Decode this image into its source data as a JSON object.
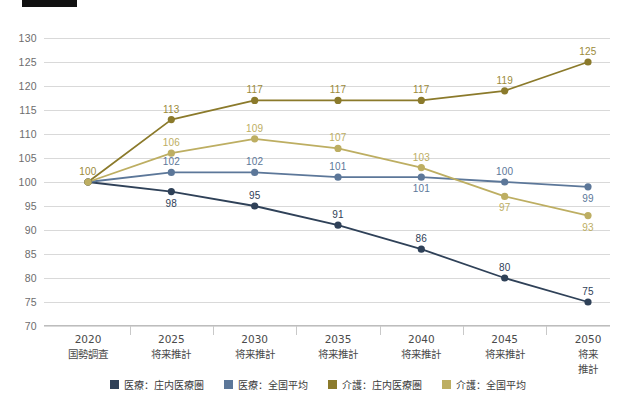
{
  "header": {
    "rule_label": ""
  },
  "chart_data": {
    "type": "line",
    "title": "",
    "xlabel": "",
    "ylabel": "",
    "ylim": [
      70,
      130
    ],
    "ystep": 5,
    "grid": true,
    "legend_position": "bottom",
    "yticks": [
      130,
      125,
      120,
      115,
      110,
      105,
      100,
      95,
      90,
      85,
      80,
      75,
      70
    ],
    "categories": [
      "2020",
      "2025",
      "2030",
      "2035",
      "2040",
      "2045",
      "2050"
    ],
    "category_sublabels": [
      "国勢調査",
      "将来推計",
      "将来推計",
      "将来推計",
      "将来推計",
      "将来推計",
      "将来推計"
    ],
    "series": [
      {
        "name": "医療：庄内医療圏",
        "color": "#2f4158",
        "label_color": "#2f4158",
        "values": [
          100,
          98,
          95,
          91,
          86,
          80,
          75
        ],
        "label_side": [
          "up",
          "down",
          "up",
          "up",
          "up",
          "up",
          "up"
        ]
      },
      {
        "name": "医療：全国平均",
        "color": "#5c7799",
        "label_color": "#5c7799",
        "values": [
          100,
          102,
          102,
          101,
          101,
          100,
          99
        ],
        "label_side": [
          "up",
          "up",
          "up",
          "up",
          "down",
          "up",
          "down"
        ]
      },
      {
        "name": "介護：庄内医療圏",
        "color": "#8b7a2b",
        "label_color": "#9b8a3a",
        "values": [
          100,
          113,
          117,
          117,
          117,
          119,
          125
        ],
        "label_side": [
          "up",
          "up",
          "up",
          "up",
          "up",
          "up",
          "up"
        ]
      },
      {
        "name": "介護：全国平均",
        "color": "#bdae62",
        "label_color": "#bdae62",
        "values": [
          100,
          106,
          109,
          107,
          103,
          97,
          93
        ],
        "label_side": [
          "up",
          "up",
          "up",
          "up",
          "up",
          "down",
          "down"
        ]
      }
    ]
  }
}
